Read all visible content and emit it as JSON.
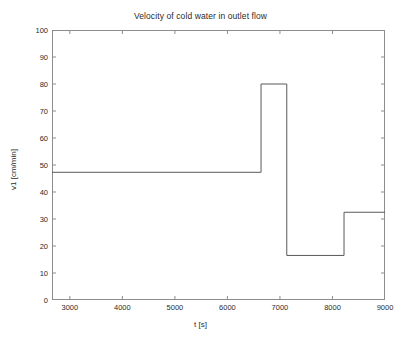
{
  "chart_data": {
    "type": "line",
    "title": "Velocity of cold water in outlet flow",
    "xlabel": "t [s]",
    "ylabel": "v1 [cm/min]",
    "xlim": [
      2660,
      9000
    ],
    "ylim": [
      0,
      100
    ],
    "xticks": [
      3000,
      4000,
      5000,
      6000,
      7000,
      8000,
      9000
    ],
    "xticklabels": [
      "3000",
      "4000",
      "5000",
      "6000",
      "7000",
      "8000",
      "9000"
    ],
    "yticks": [
      0,
      10,
      20,
      30,
      40,
      50,
      60,
      70,
      80,
      90,
      100
    ],
    "yticklabels": [
      "0",
      "10",
      "20",
      "30",
      "40",
      "50",
      "60",
      "70",
      "80",
      "90",
      "100"
    ],
    "grid": false,
    "legend": null,
    "series": [
      {
        "name": "v1",
        "style": "step",
        "color": "#595959",
        "x": [
          2660,
          6640,
          6640,
          7130,
          7130,
          8220,
          8220,
          9000
        ],
        "y": [
          47.3,
          47.3,
          80.0,
          80.0,
          16.5,
          16.5,
          32.5,
          32.5
        ]
      }
    ],
    "steps": [
      {
        "t_start": 2660,
        "t_end": 6640,
        "value": 47.3
      },
      {
        "t_start": 6640,
        "t_end": 7130,
        "value": 80.0
      },
      {
        "t_start": 7130,
        "t_end": 8220,
        "value": 16.5
      },
      {
        "t_start": 8220,
        "t_end": 9000,
        "value": 32.5
      }
    ]
  }
}
